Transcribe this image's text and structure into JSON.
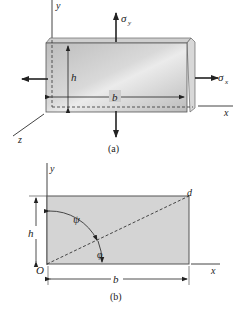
{
  "figure_a": {
    "caption": "(a)",
    "labels": {
      "y_axis": "y",
      "x_axis": "x",
      "z_axis": "z",
      "height": "h",
      "width": "b",
      "sigma_y": "σ",
      "sigma_y_sub": "y",
      "sigma_x": "σ",
      "sigma_x_sub": "x"
    }
  },
  "figure_b": {
    "caption": "(b)",
    "labels": {
      "y_axis": "y",
      "x_axis": "x",
      "origin": "O",
      "corner": "d",
      "height": "h",
      "width": "b",
      "psi": "ψ",
      "phi": "φ"
    }
  },
  "colors": {
    "line": "#333333",
    "plate_fill_light": "#e6e6e6",
    "plate_fill_dark": "#b9b9b9",
    "rect_fill": "#d4d4d4"
  }
}
